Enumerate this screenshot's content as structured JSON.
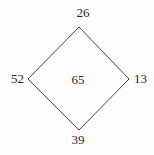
{
  "diagram": {
    "type": "diamond-number-puzzle",
    "labels": {
      "top": "26",
      "right": "13",
      "bottom": "39",
      "left": "52",
      "center": "65"
    },
    "colors": {
      "line": "#444444",
      "text": "#1f1f1f",
      "background": "#fdfdfd"
    }
  }
}
